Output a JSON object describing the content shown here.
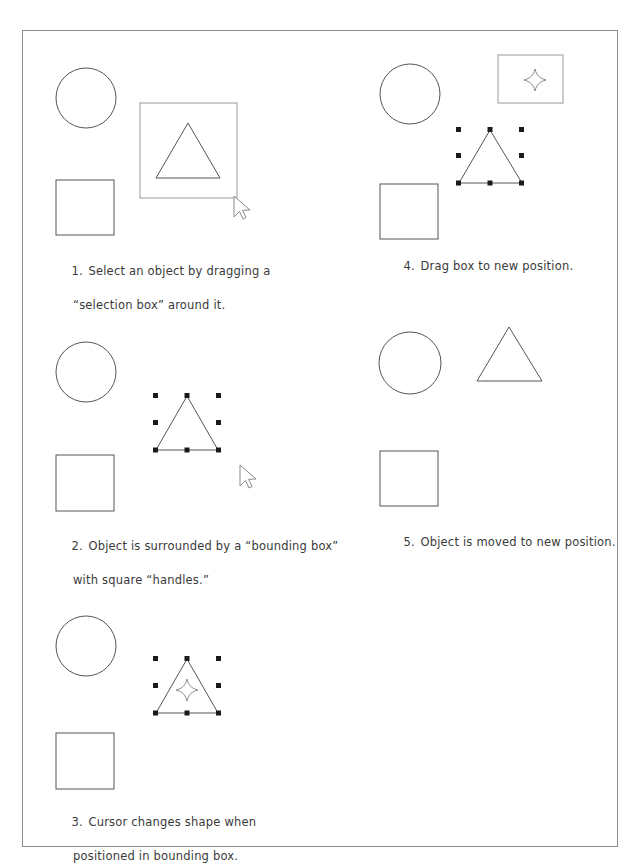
{
  "document": {
    "title": "Selecting and Moving an Object",
    "frame_color": "#8d8d8d",
    "ink_color": "#555555",
    "handle_color": "#1a1a1a",
    "text_color": "#3a3a3a"
  },
  "panels": [
    {
      "id": "panel-1",
      "number": "1.",
      "caption_line1": "Select an object by dragging a",
      "caption_line2": "“selection box” around it.",
      "shapes": [
        "circle",
        "square",
        "triangle",
        "selection-box"
      ],
      "cursor": "arrow-pointer"
    },
    {
      "id": "panel-2",
      "number": "2.",
      "caption_line1": "Object is surrounded by a “bounding box”",
      "caption_line2": "with square “handles.”",
      "shapes": [
        "circle",
        "square",
        "triangle",
        "bounding-box-handles"
      ],
      "cursor": "arrow-pointer"
    },
    {
      "id": "panel-3",
      "number": "3.",
      "caption_line1": "Cursor changes shape when",
      "caption_line2": "positioned in bounding box.",
      "shapes": [
        "circle",
        "square",
        "triangle",
        "bounding-box-handles"
      ],
      "cursor": "move-cursor"
    },
    {
      "id": "panel-4",
      "number": "4.",
      "caption_line1": "Drag box to new position.",
      "caption_line2": "",
      "shapes": [
        "circle",
        "square",
        "triangle",
        "bounding-box-handles",
        "drag-ghost-rectangle"
      ],
      "cursor": "move-cursor"
    },
    {
      "id": "panel-5",
      "number": "5.",
      "caption_line1": "Object is moved to new position.",
      "caption_line2": "",
      "shapes": [
        "circle",
        "square",
        "triangle-moved"
      ],
      "cursor": "none"
    }
  ]
}
